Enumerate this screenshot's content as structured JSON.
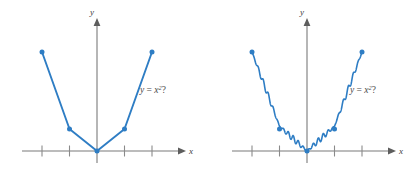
{
  "figure": {
    "background": "#ffffff",
    "accent_color": "#2E7DC4",
    "axis_color": "#7a7a7a",
    "panel_count": 2
  },
  "chart_data": [
    {
      "type": "line",
      "panel": "left",
      "title": "",
      "xlabel": "x",
      "ylabel": "y",
      "annotation": "y = x2?",
      "annotation_parts": {
        "lhs": "y",
        "operator": "=",
        "base": "x",
        "exponent": "2",
        "suffix": "?"
      },
      "style": "piecewise-linear",
      "grid": false,
      "legend": false,
      "xlim": [
        -2.5,
        2.5
      ],
      "ylim": [
        0,
        4.6
      ],
      "xticks": [
        -2,
        -1,
        1,
        2
      ],
      "xtick_labels": [
        "",
        "",
        "",
        ""
      ],
      "yticks": [],
      "markers": true,
      "x": [
        -2,
        -1,
        0,
        1,
        2
      ],
      "values": [
        4,
        1,
        0,
        1,
        4
      ],
      "series": [
        {
          "name": "sampled points joined by segments",
          "x": [
            -2,
            -1,
            0,
            1,
            2
          ],
          "values": [
            4,
            1,
            0,
            1,
            4
          ]
        }
      ]
    },
    {
      "type": "line",
      "panel": "right",
      "title": "",
      "xlabel": "x",
      "ylabel": "y",
      "annotation": "y = x2?",
      "annotation_parts": {
        "lhs": "y",
        "operator": "=",
        "base": "x",
        "exponent": "2",
        "suffix": "?"
      },
      "style": "oscillating-through-points",
      "grid": false,
      "legend": false,
      "xlim": [
        -2.5,
        2.5
      ],
      "ylim": [
        0,
        4.6
      ],
      "xticks": [
        -2,
        -1,
        1,
        2
      ],
      "xtick_labels": [
        "",
        "",
        "",
        ""
      ],
      "yticks": [],
      "markers": true,
      "x": [
        -2,
        -1,
        0,
        1,
        2
      ],
      "values": [
        4,
        1,
        0,
        1,
        4
      ],
      "oscillation": {
        "amplitude": 0.12,
        "cycles_per_unit": 5.5
      },
      "series": [
        {
          "name": "wavy curve through same sampled points",
          "x": [
            -2,
            -1,
            0,
            1,
            2
          ],
          "values": [
            4,
            1,
            0,
            1,
            4
          ]
        }
      ]
    }
  ]
}
